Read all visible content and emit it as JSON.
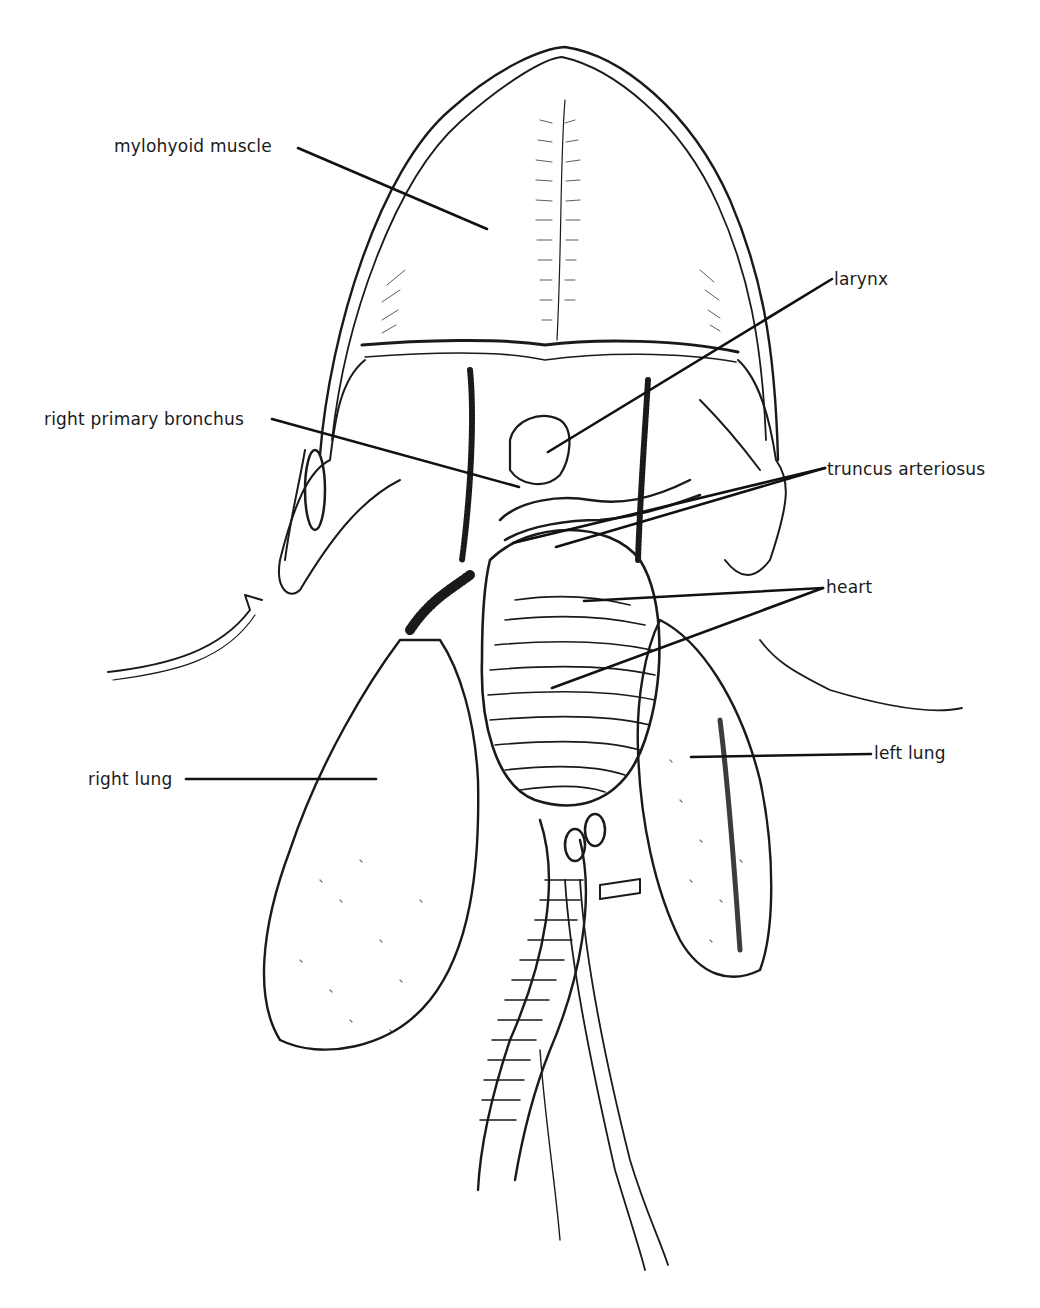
{
  "diagram": {
    "ink_color": "#1a1a1a",
    "background": "#ffffff",
    "labels": [
      {
        "id": "mylohyoid",
        "text": "mylohyoid muscle",
        "x": 114,
        "y": 138,
        "line": [
          [
            298,
            148
          ],
          [
            487,
            229
          ]
        ]
      },
      {
        "id": "larynx",
        "text": "larynx",
        "x": 834,
        "y": 271,
        "line": [
          [
            832,
            279
          ],
          [
            548,
            452
          ]
        ]
      },
      {
        "id": "bronchus",
        "text": "right primary bronchus",
        "x": 44,
        "y": 411,
        "line": [
          [
            272,
            419
          ],
          [
            519,
            487
          ]
        ]
      },
      {
        "id": "truncus",
        "text": "truncus arteriosus",
        "x": 827,
        "y": 463,
        "line_a": [
          [
            825,
            468
          ],
          [
            513,
            543
          ]
        ],
        "line_b": [
          [
            825,
            468
          ],
          [
            556,
            547
          ]
        ]
      },
      {
        "id": "heart",
        "text": "heart",
        "x": 826,
        "y": 580,
        "line_a": [
          [
            823,
            588
          ],
          [
            584,
            601
          ]
        ],
        "line_b": [
          [
            823,
            588
          ],
          [
            552,
            688
          ]
        ]
      },
      {
        "id": "right_lung",
        "text": "right lung",
        "x": 88,
        "y": 773,
        "line": [
          [
            186,
            779
          ],
          [
            376,
            779
          ]
        ]
      },
      {
        "id": "left_lung",
        "text": "left lung",
        "x": 874,
        "y": 746,
        "line": [
          [
            871,
            754
          ],
          [
            691,
            757
          ]
        ]
      }
    ]
  }
}
